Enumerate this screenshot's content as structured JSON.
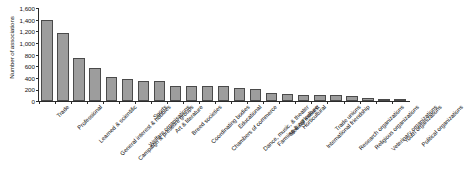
{
  "chart_data": {
    "type": "bar",
    "title": "",
    "xlabel": "",
    "ylabel": "Number of associations",
    "ylim": [
      0,
      1600
    ],
    "ytick_labels": [
      "1,600",
      "1,400",
      "1,200",
      "1,000",
      "800",
      "600",
      "400",
      "200",
      "0"
    ],
    "ytick_values": [
      1600,
      1400,
      1200,
      1000,
      800,
      600,
      400,
      200,
      0
    ],
    "ytick_step": 200,
    "grid": false,
    "legend": null,
    "bar_color": "#9d9d9d",
    "bar_edge_color": "#4a4a4a",
    "axis_color": "#2b2b2b",
    "categories": [
      "Trade",
      "Professional",
      "Learned & scientific",
      "General interest & hobbies",
      "Campaign & pressure groups",
      "Welfare organisations",
      "Sports",
      "Art & literature",
      "Breed societies",
      "Coordinating bodies",
      "Chambers of commerce",
      "Educational",
      "Dance, music, & theater",
      "Farming & agriculture",
      "Medical interest",
      "Horticultural",
      "International friendship",
      "Trade unions",
      "Research organizations",
      "Religious organizations",
      "Veterinary organizations",
      "Youth organizations",
      "Political organizations"
    ],
    "values": [
      1400,
      1170,
      740,
      570,
      420,
      380,
      345,
      340,
      260,
      255,
      250,
      250,
      230,
      200,
      130,
      120,
      110,
      100,
      95,
      90,
      60,
      40,
      20
    ]
  }
}
